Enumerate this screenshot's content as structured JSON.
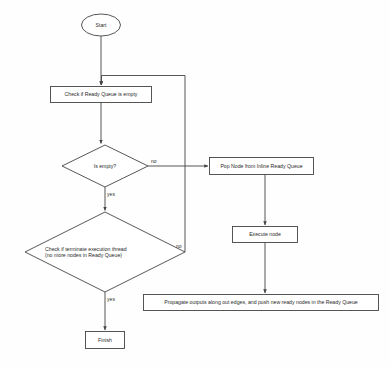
{
  "diagram": {
    "stroke_color": "#444444",
    "fill_color": "#ffffff",
    "text_color": "#2a2a2a",
    "background_color": "#fefefe"
  },
  "nodes": {
    "start": {
      "id": "start",
      "shape": "ellipse",
      "label": "Start"
    },
    "check_ready_queue": {
      "id": "check_ready_queue",
      "shape": "rectangle",
      "label": "Check if Ready Queue is empty"
    },
    "is_empty": {
      "id": "is_empty",
      "shape": "diamond",
      "label": "Is empty?"
    },
    "check_terminate": {
      "id": "check_terminate",
      "shape": "diamond",
      "label": "Check if terminate execution thread\n(no more nodes in Ready Queue)"
    },
    "finish": {
      "id": "finish",
      "shape": "rectangle",
      "label": "Finish"
    },
    "pop_node": {
      "id": "pop_node",
      "shape": "rectangle",
      "label": "Pop Node from Inline Ready Queue"
    },
    "execute_node": {
      "id": "execute_node",
      "shape": "rectangle",
      "label": "Execute node"
    },
    "propagate_outputs": {
      "id": "propagate_outputs",
      "shape": "rectangle",
      "label": "Propagate outputs along out edges, and push new ready nodes in the Ready Queue"
    }
  },
  "edge_labels": {
    "is_empty_no": "no",
    "is_empty_yes": "yes",
    "terminate_no": "no",
    "terminate_yes": "yes"
  }
}
